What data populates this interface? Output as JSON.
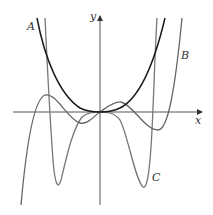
{
  "figure": {
    "axes": {
      "x_label": "x",
      "y_label": "y"
    },
    "curves": [
      {
        "id": "A",
        "label": "A",
        "color": "#1a1a1a",
        "description": "even quartic-like curve, flat at origin, rising steeply on both sides"
      },
      {
        "id": "B",
        "label": "B",
        "color": "#666666",
        "description": "oscillating curve through origin with local max left, local min left, local max right, local min right, then rising"
      },
      {
        "id": "C",
        "label": "C",
        "color": "#777777",
        "description": "curve with two deep minima on either side of origin, flat near origin, steep on both ends"
      }
    ]
  },
  "labels": {
    "a": "A",
    "b": "B",
    "c": "C",
    "x": "x",
    "y": "y"
  }
}
